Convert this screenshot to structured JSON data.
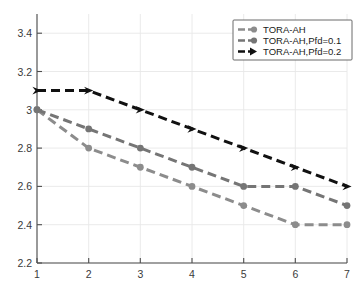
{
  "chart_data": {
    "type": "line",
    "title": "",
    "xlabel": "",
    "ylabel": "",
    "x": [
      1,
      2,
      3,
      4,
      5,
      6,
      7
    ],
    "xticklabels": [
      "1",
      "2",
      "3",
      "4",
      "5",
      "6",
      "7"
    ],
    "yticklabels": [
      "2.2",
      "2.4",
      "2.6",
      "2.8",
      "3",
      "3.2",
      "3.4"
    ],
    "yticks": [
      2.2,
      2.4,
      2.6,
      2.8,
      3.0,
      3.2,
      3.4
    ],
    "xlim": [
      1,
      7
    ],
    "ylim": [
      2.2,
      3.5
    ],
    "grid": true,
    "legend_position": "top-right",
    "linestyle": "dashed",
    "series": [
      {
        "name": "TORA-AH",
        "color": "#8c8c8c",
        "marker": "circle",
        "values": [
          3.0,
          2.8,
          2.7,
          2.6,
          2.5,
          2.4,
          2.4
        ]
      },
      {
        "name": "TORA-AH,Pfd=0.1",
        "color": "#757575",
        "marker": "circle",
        "values": [
          3.0,
          2.9,
          2.8,
          2.7,
          2.6,
          2.6,
          2.5
        ]
      },
      {
        "name": "TORA-AH,Pfd=0.2",
        "color": "#111111",
        "marker": "arrow",
        "values": [
          3.1,
          3.1,
          3.0,
          2.9,
          2.8,
          2.7,
          2.6
        ]
      }
    ]
  },
  "legend": {
    "entries": [
      {
        "label": "TORA-AH"
      },
      {
        "label": "TORA-AH,Pfd=0.1"
      },
      {
        "label": "TORA-AH,Pfd=0.2"
      }
    ]
  },
  "colors": {
    "series_1": "#8c8c8c",
    "series_2": "#757575",
    "series_3": "#111111",
    "axis": "#4d4d4d",
    "grid": "#e8e8e8",
    "background": "#ffffff"
  }
}
